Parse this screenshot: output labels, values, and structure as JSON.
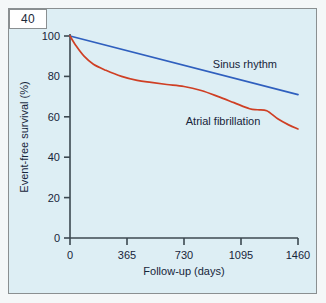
{
  "figure": {
    "number": "40",
    "panel_bg": "#ddeef4",
    "border_color": "#8a8f91"
  },
  "chart_data": {
    "type": "line",
    "title": "",
    "subtitle": "",
    "xlabel": "Follow-up (days)",
    "ylabel": "Event-free survival (%)",
    "xlim": [
      0,
      1460
    ],
    "ylim": [
      0,
      100
    ],
    "xticks": [
      0,
      365,
      730,
      1095,
      1460
    ],
    "xticklabels": [
      "0",
      "365",
      "730",
      "1095",
      "1460"
    ],
    "yticks": [
      0,
      20,
      40,
      60,
      80,
      100
    ],
    "yticklabels": [
      "0",
      "20",
      "40",
      "60",
      "80",
      "100"
    ],
    "grid": false,
    "legend": "inline-annotations",
    "series": [
      {
        "name": "Sinus rhythm",
        "color": "#2f5fbe",
        "label_x": 1120,
        "label_y": 84,
        "x": [
          0,
          1460
        ],
        "values": [
          100,
          71
        ]
      },
      {
        "name": "Atrial fibrillation",
        "color": "#cf3f24",
        "label_x": 980,
        "label_y": 56,
        "x": [
          0,
          40,
          90,
          150,
          230,
          330,
          430,
          520,
          620,
          730,
          840,
          950,
          1050,
          1150,
          1200,
          1260,
          1330,
          1400,
          1460
        ],
        "values": [
          100,
          95,
          90,
          86,
          83,
          80,
          78,
          77,
          76,
          75,
          73,
          70,
          67,
          64,
          63.5,
          63,
          59,
          56,
          54
        ]
      }
    ],
    "annotations": [
      {
        "text": "Sinus rhythm",
        "series": "Sinus rhythm"
      },
      {
        "text": "Atrial fibrillation",
        "series": "Atrial fibrillation"
      }
    ]
  }
}
